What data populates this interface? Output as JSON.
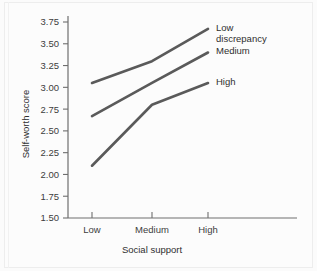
{
  "chart_data": {
    "type": "line",
    "title": "",
    "xlabel": "Social support",
    "ylabel": "Self-worth score",
    "categories": [
      "Low",
      "Medium",
      "High"
    ],
    "yticks": [
      "1.50",
      "1.75",
      "2.00",
      "2.25",
      "2.50",
      "2.75",
      "3.00",
      "3.25",
      "3.50",
      "3.75"
    ],
    "ylim": [
      1.5,
      3.75
    ],
    "ystep": 0.25,
    "grid": false,
    "legend_position": "inline-right",
    "line_color": "#5a5a5a",
    "axis_color": "#6e6e6e",
    "background_color": "#fcfcfc",
    "series": [
      {
        "name": "Low discrepancy",
        "label_line1": "Low",
        "label_line2": "discrepancy",
        "values": [
          3.05,
          3.3,
          3.67
        ]
      },
      {
        "name": "Medium",
        "label_line1": "Medium",
        "label_line2": "",
        "values": [
          2.67,
          3.05,
          3.4
        ]
      },
      {
        "name": "High",
        "label_line1": "High",
        "label_line2": "",
        "values": [
          2.1,
          2.8,
          3.05
        ]
      }
    ]
  }
}
